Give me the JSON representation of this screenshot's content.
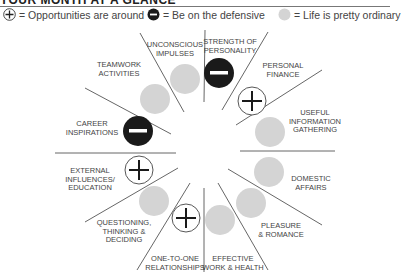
{
  "title": "YOUR MONTH AT A GLANCE",
  "legend": [
    {
      "icon": "plus-circle-icon",
      "label": "= Opportunities are around"
    },
    {
      "icon": "minus-circle-icon",
      "label": "= Be on the defensive"
    },
    {
      "icon": "grey-circle-icon",
      "label": "= Life is pretty ordinary"
    }
  ],
  "colors": {
    "grey": "#d4d4d4",
    "black": "#1a1a1a",
    "line": "#555555"
  },
  "sectors": [
    {
      "name": "strength-of-personality",
      "line1": "STRENGTH OF",
      "line2": "PERSONALITY",
      "line3": "",
      "status": "defensive"
    },
    {
      "name": "personal-finance",
      "line1": "PERSONAL",
      "line2": "FINANCE",
      "line3": "",
      "status": "opportunity"
    },
    {
      "name": "useful-information-gathering",
      "line1": "USEFUL",
      "line2": "INFORMATION",
      "line3": "GATHERING",
      "status": "ordinary"
    },
    {
      "name": "domestic-affairs",
      "line1": "DOMESTIC",
      "line2": "AFFAIRS",
      "line3": "",
      "status": "ordinary"
    },
    {
      "name": "pleasure-romance",
      "line1": "PLEASURE",
      "line2": "& ROMANCE",
      "line3": "",
      "status": "ordinary"
    },
    {
      "name": "effective-work-health",
      "line1": "EFFECTIVE",
      "line2": "WORK & HEALTH",
      "line3": "",
      "status": "ordinary"
    },
    {
      "name": "one-to-one-relationships",
      "line1": "ONE-TO-ONE",
      "line2": "RELATIONSHIPS",
      "line3": "",
      "status": "opportunity"
    },
    {
      "name": "questioning-thinking-deciding",
      "line1": "QUESTIONING,",
      "line2": "THINKING &",
      "line3": "DECIDING",
      "status": "ordinary"
    },
    {
      "name": "external-influences-education",
      "line1": "EXTERNAL",
      "line2": "INFLUENCES/",
      "line3": "EDUCATION",
      "status": "opportunity"
    },
    {
      "name": "career-inspirations",
      "line1": "CAREER",
      "line2": "INSPIRATIONS",
      "line3": "",
      "status": "defensive"
    },
    {
      "name": "teamwork-activities",
      "line1": "TEAMWORK",
      "line2": "ACTIVITIES",
      "line3": "",
      "status": "ordinary"
    },
    {
      "name": "unconscious-impulses",
      "line1": "UNCONSCIOUS",
      "line2": "IMPULSES",
      "line3": "",
      "status": "ordinary"
    }
  ]
}
